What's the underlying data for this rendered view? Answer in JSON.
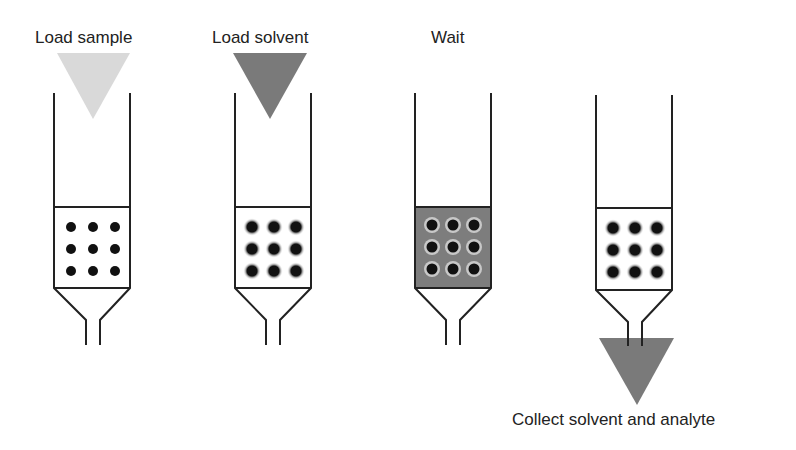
{
  "steps": [
    {
      "label": "Load sample",
      "x": 35,
      "y": 0
    },
    {
      "label": "Load solvent",
      "x": 212,
      "y": 0
    },
    {
      "label": "Wait",
      "x": 431,
      "y": 0
    },
    {
      "label": "Collect solvent and analyte",
      "x": 512,
      "y": 410
    }
  ],
  "colors": {
    "line": "#222222",
    "sample_triangle": "#d9d9d9",
    "solvent_triangle": "#7a7a7a",
    "wait_fill": "#7d7d7d",
    "collect_triangle": "#7a7a7a",
    "bead": "#111111",
    "bead_halo": "#bdbdbd"
  }
}
